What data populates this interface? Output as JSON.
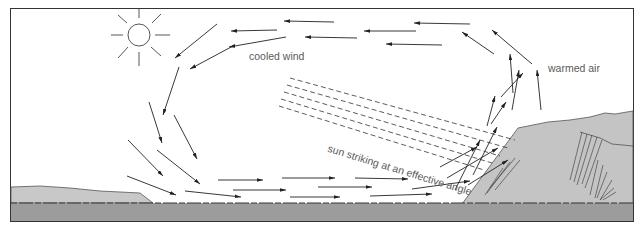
{
  "diagram": {
    "type": "convection-wind-cross-section",
    "labels": {
      "cooled_wind": "cooled wind",
      "warmed_air": "warmed air",
      "sun_ray": "sun striking at an effective angle"
    },
    "elements": [
      "sun",
      "circulating wind arrows",
      "dashed sun rays",
      "sunlit slope",
      "low shore",
      "ground band"
    ],
    "colors": {
      "frame": "#333333",
      "arrow": "#222222",
      "land_light": "#c4c4c4",
      "ground_dark": "#9a9a9a",
      "label": "#5a5a5a"
    }
  }
}
